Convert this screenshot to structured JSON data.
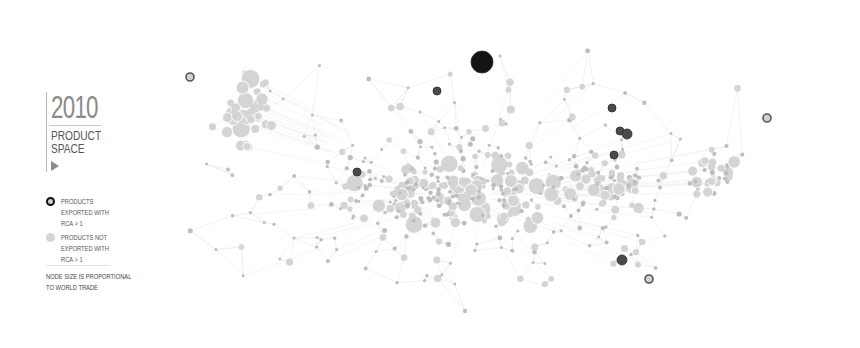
{
  "title": {
    "year": "2010",
    "subtitle": "PRODUCT\nSPACE"
  },
  "legend": {
    "exported": {
      "label": "PRODUCTS\nEXPORTED WITH\nRCA > 1",
      "color": "#111111"
    },
    "not_exported": {
      "label": "PRODUCTS NOT\nEXPORTED WITH\nRCA > 1",
      "color": "#d6d6d6"
    },
    "note": "NODE SIZE IS PROPORTIONAL\nTO WORLD TRADE"
  },
  "colors": {
    "background": "#ffffff",
    "edge": "#ececec",
    "node": "#d4d4d4",
    "node_dark": "#bdbdbd",
    "rca": "#2a2a2a"
  },
  "chart_data": {
    "type": "network",
    "legend": [
      "Products exported with RCA > 1",
      "Products not exported with RCA > 1"
    ],
    "annotation": "Node size is proportional to world trade",
    "rca_nodes": [
      {
        "x": 482,
        "y": 62,
        "r": 11,
        "style": "fill"
      },
      {
        "x": 190,
        "y": 77,
        "r": 4,
        "style": "ring"
      },
      {
        "x": 437,
        "y": 91,
        "r": 4,
        "style": "fill"
      },
      {
        "x": 357,
        "y": 172,
        "r": 4,
        "style": "fill"
      },
      {
        "x": 612,
        "y": 108,
        "r": 4,
        "style": "fill"
      },
      {
        "x": 620,
        "y": 131,
        "r": 4,
        "style": "fill"
      },
      {
        "x": 627,
        "y": 134,
        "r": 5,
        "style": "fill"
      },
      {
        "x": 614,
        "y": 155,
        "r": 4,
        "style": "fill"
      },
      {
        "x": 622,
        "y": 260,
        "r": 5,
        "style": "fill"
      },
      {
        "x": 649,
        "y": 279,
        "r": 4,
        "style": "ring"
      },
      {
        "x": 767,
        "y": 118,
        "r": 4,
        "style": "ring"
      }
    ],
    "clusters": [
      {
        "name": "left-top cluster",
        "cx": 250,
        "cy": 115,
        "rx": 50,
        "ry": 50,
        "count": 45,
        "rmin": 3,
        "rmax": 10
      },
      {
        "name": "central band",
        "cx": 460,
        "cy": 195,
        "rx": 160,
        "ry": 45,
        "count": 170,
        "rmin": 2,
        "rmax": 9
      },
      {
        "name": "center-right band",
        "cx": 600,
        "cy": 185,
        "rx": 80,
        "ry": 40,
        "count": 70,
        "rmin": 2,
        "rmax": 7
      },
      {
        "name": "right cluster",
        "cx": 715,
        "cy": 170,
        "rx": 40,
        "ry": 35,
        "count": 35,
        "rmin": 2,
        "rmax": 7
      },
      {
        "name": "periphery",
        "cx": 470,
        "cy": 180,
        "rx": 340,
        "ry": 150,
        "count": 260,
        "rmin": 1.5,
        "rmax": 4
      }
    ]
  }
}
